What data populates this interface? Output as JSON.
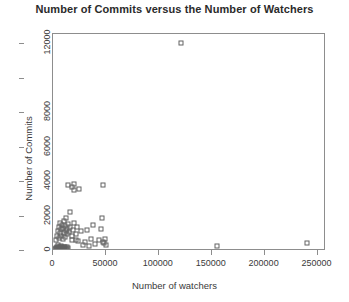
{
  "chart_data": {
    "type": "scatter",
    "title": "Number of Commits versus the Number of Watchers",
    "xlabel": "Number of watchers",
    "ylabel": "Number of Commits",
    "xlim": [
      0,
      258000
    ],
    "ylim": [
      0,
      12600
    ],
    "grid": false,
    "legend": null,
    "marker": "open-square",
    "marker_color": "#636363",
    "xticks": [
      0,
      50000,
      100000,
      150000,
      200000,
      250000
    ],
    "xticklabels": [
      "0",
      "50000",
      "100000",
      "150000",
      "200000",
      "250000"
    ],
    "yticks": [
      0,
      2000,
      4000,
      6000,
      8000,
      10000,
      12000
    ],
    "yticklabels": [
      "0",
      "2000",
      "4000",
      "6000",
      "8000",
      "",
      "12000"
    ],
    "points": [
      [
        2000,
        120
      ],
      [
        2500,
        200
      ],
      [
        3000,
        90
      ],
      [
        3500,
        260
      ],
      [
        4000,
        150
      ],
      [
        4200,
        60
      ],
      [
        4800,
        330
      ],
      [
        5000,
        180
      ],
      [
        5200,
        95
      ],
      [
        5600,
        240
      ],
      [
        6000,
        140
      ],
      [
        6300,
        70
      ],
      [
        6800,
        210
      ],
      [
        7000,
        120
      ],
      [
        7400,
        300
      ],
      [
        7800,
        160
      ],
      [
        8000,
        85
      ],
      [
        8400,
        230
      ],
      [
        8800,
        130
      ],
      [
        9200,
        190
      ],
      [
        9600,
        110
      ],
      [
        10000,
        260
      ],
      [
        10400,
        75
      ],
      [
        10800,
        170
      ],
      [
        11200,
        210
      ],
      [
        11800,
        140
      ],
      [
        12400,
        95
      ],
      [
        13000,
        240
      ],
      [
        13600,
        130
      ],
      [
        14200,
        180
      ],
      [
        3000,
        640
      ],
      [
        4000,
        900
      ],
      [
        5000,
        1180
      ],
      [
        5500,
        760
      ],
      [
        6000,
        1400
      ],
      [
        6500,
        1020
      ],
      [
        7000,
        1620
      ],
      [
        7500,
        880
      ],
      [
        8000,
        1260
      ],
      [
        8500,
        1500
      ],
      [
        9000,
        700
      ],
      [
        9500,
        1340
      ],
      [
        10000,
        1060
      ],
      [
        10500,
        1760
      ],
      [
        11000,
        820
      ],
      [
        11500,
        1480
      ],
      [
        12000,
        1150
      ],
      [
        12500,
        1900
      ],
      [
        13000,
        960
      ],
      [
        13500,
        1300
      ],
      [
        14500,
        1580
      ],
      [
        15500,
        1120
      ],
      [
        16500,
        1420
      ],
      [
        17500,
        860
      ],
      [
        18500,
        1240
      ],
      [
        20000,
        1640
      ],
      [
        21500,
        980
      ],
      [
        23000,
        1380
      ],
      [
        16000,
        2280
      ],
      [
        18000,
        640
      ],
      [
        22000,
        620
      ],
      [
        24000,
        560
      ],
      [
        26000,
        1180
      ],
      [
        28000,
        360
      ],
      [
        30000,
        540
      ],
      [
        32000,
        1200
      ],
      [
        34000,
        300
      ],
      [
        36000,
        700
      ],
      [
        38000,
        1500
      ],
      [
        40000,
        420
      ],
      [
        43000,
        620
      ],
      [
        45000,
        1260
      ],
      [
        47000,
        500
      ],
      [
        48500,
        460
      ],
      [
        49500,
        720
      ],
      [
        50000,
        340
      ],
      [
        46000,
        1940
      ],
      [
        14000,
        3820
      ],
      [
        18000,
        3700
      ],
      [
        19500,
        3560
      ],
      [
        20000,
        3900
      ],
      [
        25000,
        3600
      ],
      [
        47500,
        3820
      ],
      [
        120500,
        12050
      ],
      [
        155000,
        300
      ],
      [
        240000,
        480
      ]
    ]
  }
}
